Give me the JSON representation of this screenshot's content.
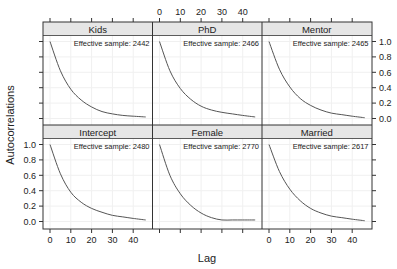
{
  "chart_data": {
    "type": "line",
    "layout": "trellis-3x2",
    "xlabel": "Lag",
    "ylabel": "Autocorrelations",
    "xlim": [
      0,
      46
    ],
    "ylim": [
      0,
      1
    ],
    "x_ticks": [
      0,
      10,
      20,
      30,
      40
    ],
    "y_ticks": [
      "0.0",
      "0.2",
      "0.4",
      "0.6",
      "0.8",
      "1.0"
    ],
    "grid": true,
    "line_color": "#555555",
    "strip_color": "#e6e6e6",
    "panels": [
      {
        "name": "Kids",
        "row": 0,
        "col": 0,
        "annotation": "Effective sample: 2442",
        "x": [
          0,
          5,
          10,
          15,
          20,
          25,
          30,
          35,
          40,
          46
        ],
        "y": [
          1.0,
          0.62,
          0.38,
          0.24,
          0.15,
          0.09,
          0.06,
          0.04,
          0.03,
          0.02
        ]
      },
      {
        "name": "PhD",
        "row": 0,
        "col": 1,
        "annotation": "Effective sample: 2466",
        "x": [
          0,
          5,
          10,
          15,
          20,
          25,
          30,
          35,
          40,
          46
        ],
        "y": [
          1.0,
          0.62,
          0.39,
          0.25,
          0.16,
          0.11,
          0.08,
          0.06,
          0.04,
          0.02
        ]
      },
      {
        "name": "Mentor",
        "row": 0,
        "col": 2,
        "annotation": "Effective sample: 2465",
        "x": [
          0,
          5,
          10,
          15,
          20,
          25,
          30,
          35,
          40,
          46
        ],
        "y": [
          1.0,
          0.64,
          0.41,
          0.26,
          0.17,
          0.11,
          0.07,
          0.05,
          0.03,
          0.01
        ]
      },
      {
        "name": "Intercept",
        "row": 1,
        "col": 0,
        "annotation": "Effective sample: 2480",
        "x": [
          0,
          5,
          10,
          15,
          20,
          25,
          30,
          35,
          40,
          46
        ],
        "y": [
          1.0,
          0.62,
          0.38,
          0.25,
          0.17,
          0.12,
          0.08,
          0.06,
          0.04,
          0.02
        ]
      },
      {
        "name": "Female",
        "row": 1,
        "col": 1,
        "annotation": "Effective sample: 2770",
        "x": [
          0,
          5,
          10,
          15,
          20,
          25,
          30,
          35,
          40,
          46
        ],
        "y": [
          1.0,
          0.6,
          0.36,
          0.21,
          0.11,
          0.05,
          0.02,
          0.02,
          0.02,
          0.02
        ]
      },
      {
        "name": "Married",
        "row": 1,
        "col": 2,
        "annotation": "Effective sample: 2617",
        "x": [
          0,
          5,
          10,
          15,
          20,
          25,
          30,
          35,
          40,
          46
        ],
        "y": [
          1.0,
          0.65,
          0.42,
          0.27,
          0.17,
          0.11,
          0.07,
          0.05,
          0.03,
          0.01
        ]
      }
    ]
  }
}
